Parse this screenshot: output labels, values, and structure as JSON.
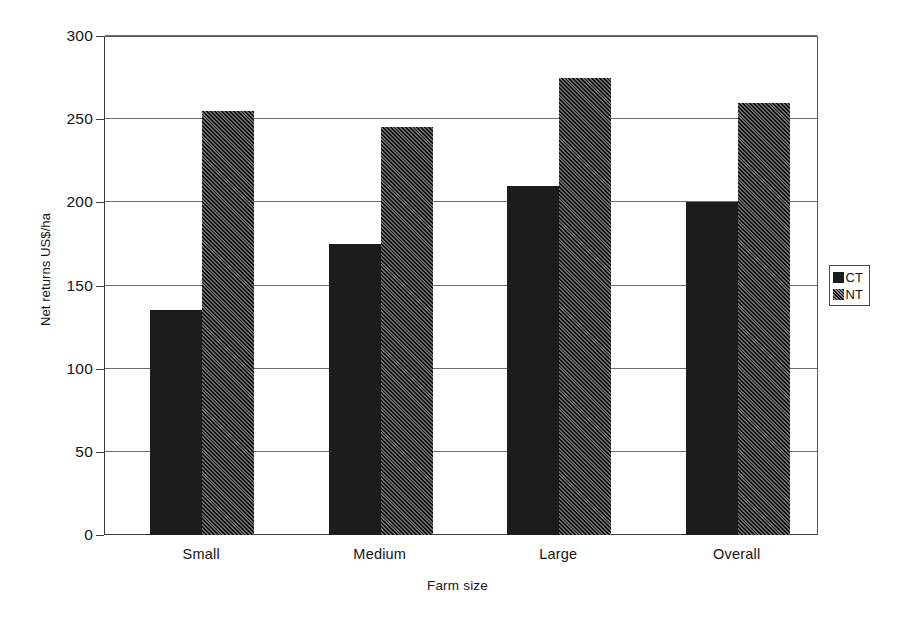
{
  "chart_data": {
    "type": "bar",
    "title": "",
    "xlabel": "Farm size",
    "ylabel": "Net returns US$/ha",
    "categories": [
      "Small",
      "Medium",
      "Large",
      "Overall"
    ],
    "series": [
      {
        "name": "CT",
        "values": [
          135,
          175,
          210,
          200
        ],
        "fill": "solid-black",
        "color": "#1c1c1c"
      },
      {
        "name": "NT",
        "values": [
          255,
          245,
          275,
          260
        ],
        "fill": "diagonal-hatch",
        "color": "#2a2a2a"
      }
    ],
    "ylim": [
      0,
      300
    ],
    "yticks": [
      0,
      50,
      100,
      150,
      200,
      250,
      300
    ],
    "ytick_labels": [
      "0",
      "50",
      "100",
      "150",
      "200",
      "250",
      "300"
    ],
    "grid": true,
    "grid_axis": "y",
    "legend_position": "right",
    "legend_entries": [
      "CT",
      "NT"
    ]
  }
}
